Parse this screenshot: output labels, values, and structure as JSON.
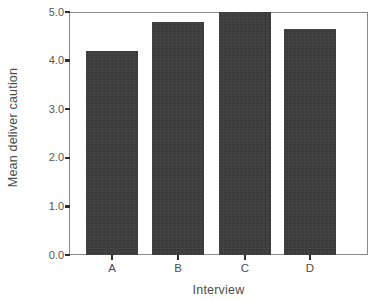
{
  "chart_data": {
    "type": "bar",
    "title": "",
    "xlabel": "Interview",
    "ylabel": "Mean  deliver caution",
    "categories": [
      "A",
      "B",
      "C",
      "D"
    ],
    "values": [
      4.2,
      4.8,
      5.0,
      4.65
    ],
    "ylim": [
      0.0,
      5.0
    ],
    "yticks": [
      "0.0",
      "1.0",
      "2.0",
      "3.0",
      "4.0",
      "5.0"
    ],
    "ytick_values": [
      0.0,
      1.0,
      2.0,
      3.0,
      4.0,
      5.0
    ],
    "grid": false,
    "legend": null,
    "bar_color": "#3b3b3b",
    "frame_color": "#8a8a8a",
    "background": "#ffffff"
  }
}
